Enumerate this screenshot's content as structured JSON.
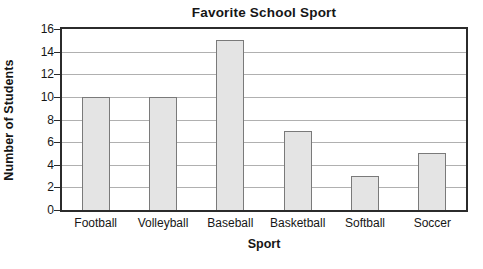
{
  "chart_data": {
    "type": "bar",
    "title": "Favorite School Sport",
    "xlabel": "Sport",
    "ylabel": "Number of Students",
    "categories": [
      "Football",
      "Volleyball",
      "Baseball",
      "Basketball",
      "Softball",
      "Soccer"
    ],
    "values": [
      10,
      10,
      15,
      7,
      3,
      5
    ],
    "ylim": [
      0,
      16
    ],
    "ytick_step": 2,
    "yticks": [
      0,
      2,
      4,
      6,
      8,
      10,
      12,
      14,
      16
    ],
    "ytick_labels": [
      "0",
      "2",
      "4",
      "6",
      "8",
      "10",
      "12",
      "14",
      "16"
    ],
    "grid": "horizontal",
    "legend": "none",
    "bar_fill_color": "#e4e4e4",
    "bar_border_color": "#7a7a7a",
    "gridline_color": "#b0b0b0",
    "axis_color": "#2b2b2b",
    "background_color": "#ffffff"
  }
}
